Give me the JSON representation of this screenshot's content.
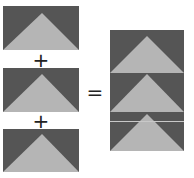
{
  "diagram": {
    "title": "",
    "operators": {
      "plus_1": "+",
      "plus_2": "+",
      "equals": "="
    },
    "colors": {
      "background": "#555555",
      "triangle": "#b5b5b5",
      "seam": "#c8c8c8"
    },
    "left_units": [
      {
        "label": "flying-geese-unit-1"
      },
      {
        "label": "flying-geese-unit-2"
      },
      {
        "label": "flying-geese-unit-3"
      }
    ],
    "result": {
      "label": "stacked-flying-geese-column",
      "units": 3
    }
  }
}
